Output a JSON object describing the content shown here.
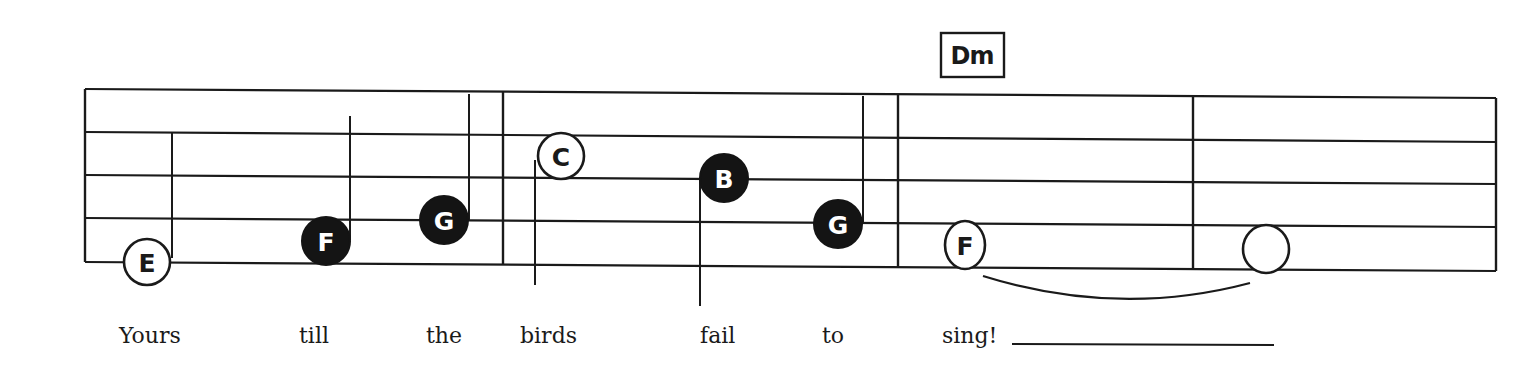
{
  "colors": {
    "ink": "#1a1a1a",
    "paper": "#ffffff"
  },
  "chord": {
    "label": "Dm"
  },
  "notes": [
    {
      "letter": "E",
      "style": "open"
    },
    {
      "letter": "F",
      "style": "filled"
    },
    {
      "letter": "G",
      "style": "filled"
    },
    {
      "letter": "C",
      "style": "open"
    },
    {
      "letter": "B",
      "style": "filled"
    },
    {
      "letter": "G",
      "style": "filled"
    },
    {
      "letter": "F",
      "style": "open"
    },
    {
      "letter": "",
      "style": "open"
    }
  ],
  "lyrics": [
    "Yours",
    "till",
    "the",
    "birds",
    "fail",
    "to",
    "sing!"
  ]
}
